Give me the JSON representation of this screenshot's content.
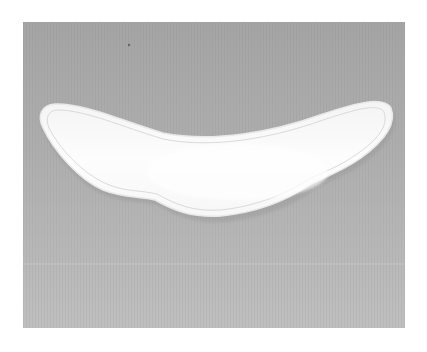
{
  "image": {
    "subject": "white curved fabric pad (collar shape) on gray background",
    "alt": "Curved white fabric piece with stitched border lying on a gray surface"
  },
  "colors": {
    "page_background": "#ffffff",
    "backdrop_top": "#a6a6a6",
    "backdrop_bottom": "#bebebe",
    "fabric_fill": "#fbfbfb",
    "fabric_edge": "#e6e6e6",
    "stitch_line": "#dcdcdc",
    "shadow": "#9a9a9a",
    "speck": "#555555"
  }
}
